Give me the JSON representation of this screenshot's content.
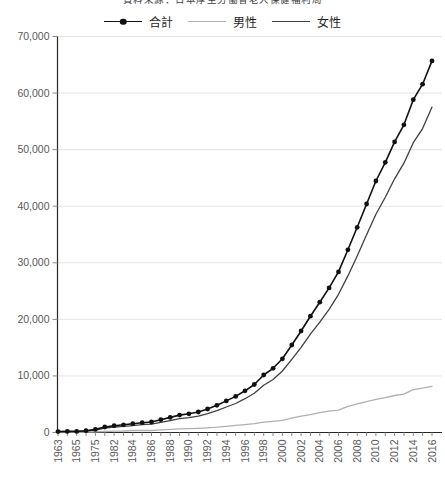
{
  "title": {
    "text": "資料来源：日本厚生労働省老人保健福利局"
  },
  "legend": {
    "items": [
      {
        "label": "合計",
        "color": "#111111",
        "marker": "dot-line"
      },
      {
        "label": "男性",
        "color": "#b0b0b0",
        "marker": "line"
      },
      {
        "label": "女性",
        "color": "#404040",
        "marker": "line"
      }
    ]
  },
  "chart_data": {
    "type": "line",
    "title": "資料来源：日本厚生労働省老人保健福利局",
    "xlabel": "",
    "ylabel": "",
    "grid": true,
    "legend_position": "top",
    "ylim": [
      0,
      70000
    ],
    "y_ticks": [
      0,
      10000,
      20000,
      30000,
      40000,
      50000,
      60000,
      70000
    ],
    "y_tick_labels": [
      "0",
      "10,000",
      "20,000",
      "30,000",
      "40,000",
      "50,000",
      "60,000",
      "70,000"
    ],
    "x_label_every": 2,
    "x": [
      1963,
      1964,
      1965,
      1970,
      1975,
      1980,
      1982,
      1983,
      1984,
      1985,
      1986,
      1987,
      1988,
      1989,
      1990,
      1991,
      1992,
      1993,
      1994,
      1995,
      1996,
      1997,
      1998,
      1999,
      2000,
      2001,
      2002,
      2003,
      2004,
      2005,
      2006,
      2007,
      2008,
      2009,
      2010,
      2011,
      2012,
      2013,
      2014,
      2015,
      2016
    ],
    "series": [
      {
        "name": "合計",
        "color": "#111111",
        "line_width": 1.6,
        "marker": "circle",
        "marker_radius": 2.4,
        "values": [
          153,
          191,
          198,
          310,
          548,
          968,
          1200,
          1354,
          1563,
          1740,
          1851,
          2271,
          2668,
          3078,
          3298,
          3625,
          4152,
          4802,
          5593,
          6378,
          7373,
          8491,
          10158,
          11346,
          13036,
          15475,
          17934,
          20561,
          23038,
          25554,
          28395,
          32295,
          36276,
          40399,
          44449,
          47756,
          51376,
          54397,
          58820,
          61568,
          65692
        ]
      },
      {
        "name": "男性",
        "color": "#b0b0b0",
        "line_width": 1.3,
        "marker": "none",
        "marker_radius": 0,
        "values": [
          20,
          31,
          36,
          62,
          102,
          174,
          233,
          269,
          347,
          359,
          361,
          462,
          562,
          630,
          680,
          749,
          822,
          943,
          1093,
          1255,
          1400,
          1570,
          1812,
          1973,
          2158,
          2541,
          2875,
          3159,
          3523,
          3779,
          3961,
          4613,
          5063,
          5447,
          5869,
          6162,
          6534,
          6791,
          7586,
          7840,
          8167
        ]
      },
      {
        "name": "女性",
        "color": "#404040",
        "line_width": 1.3,
        "marker": "none",
        "marker_radius": 0,
        "values": [
          133,
          160,
          162,
          248,
          446,
          794,
          967,
          1085,
          1216,
          1381,
          1490,
          1809,
          2106,
          2448,
          2618,
          2876,
          3330,
          3859,
          4500,
          5123,
          5973,
          6921,
          8346,
          9373,
          10878,
          12934,
          15059,
          17402,
          19515,
          21775,
          24434,
          27682,
          31213,
          34952,
          38580,
          41594,
          44842,
          47606,
          51234,
          53728,
          57525
        ]
      }
    ],
    "colors": {
      "axis": "#262626",
      "grid": "#e4e4e4",
      "tick": "#8c8c8c",
      "tick_label": "#595959"
    }
  }
}
